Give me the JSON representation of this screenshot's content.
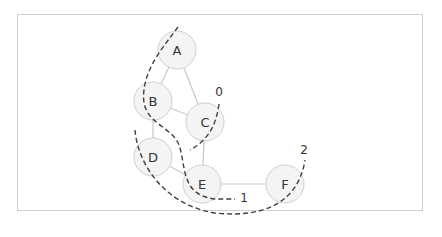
{
  "diagram": {
    "type": "graph-partition",
    "nodes": [
      {
        "id": "A",
        "label": "A",
        "cx": 177,
        "cy": 50,
        "r": 19
      },
      {
        "id": "B",
        "label": "B",
        "cx": 153,
        "cy": 101,
        "r": 19
      },
      {
        "id": "C",
        "label": "C",
        "cx": 205,
        "cy": 122,
        "r": 19
      },
      {
        "id": "D",
        "label": "D",
        "cx": 153,
        "cy": 157,
        "r": 19
      },
      {
        "id": "E",
        "label": "E",
        "cx": 202,
        "cy": 184,
        "r": 19
      },
      {
        "id": "F",
        "label": "F",
        "cx": 285,
        "cy": 184,
        "r": 19
      }
    ],
    "edges": [
      [
        "A",
        "B"
      ],
      [
        "A",
        "C"
      ],
      [
        "B",
        "C"
      ],
      [
        "B",
        "D"
      ],
      [
        "C",
        "E"
      ],
      [
        "D",
        "E"
      ],
      [
        "E",
        "F"
      ]
    ],
    "cuts": [
      {
        "id": "cut-0",
        "label": "0",
        "label_x": 219,
        "label_y": 92,
        "path": "M 219 104 C 216 126, 208 140, 190 150"
      },
      {
        "id": "cut-1",
        "label": "1",
        "label_x": 244,
        "label_y": 198,
        "path": "M 178 27 C 165 45, 140 72, 144 103 C 148 125, 175 128, 180 148 C 186 170, 182 195, 215 199 L 235 199"
      },
      {
        "id": "cut-2",
        "label": "2",
        "label_x": 304,
        "label_y": 150,
        "path": "M 135 130 C 138 165, 165 205, 215 213 C 260 218, 298 205, 305 160"
      }
    ],
    "colors": {
      "node_fill": "#f4f4f4",
      "node_stroke": "#cfcfcf",
      "edge": "#c9c9c9",
      "cut_line": "#404040",
      "text": "#333333",
      "frame_border": "#cfcfcf"
    }
  }
}
